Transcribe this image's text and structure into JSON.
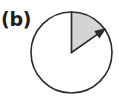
{
  "figure": {
    "panel_label": "(b)",
    "caption_text": "(b)",
    "background_color": "#ffffff",
    "stroke_color": "#2b2b2b",
    "sector_fill_color": "#d4d4d4",
    "label_color": "#1d1d1d"
  },
  "chart_data": {
    "type": "pie",
    "title": "(b)",
    "center": {
      "x": 71.5,
      "y": 52.5
    },
    "radius": 40.5,
    "start_angle_deg": 0,
    "end_angle_deg": 55,
    "sweep_direction": "clockwise",
    "angle_reference": "12 o'clock (vertical up)",
    "slices": [
      {
        "name": "shaded-sector",
        "angle_deg": 55,
        "fraction": 0.153,
        "fill": "#d4d4d4",
        "shaded": true
      },
      {
        "name": "unshaded-remainder",
        "angle_deg": 305,
        "fraction": 0.847,
        "fill": "#ffffff",
        "shaded": false
      }
    ],
    "annotations": [
      {
        "name": "arrowhead",
        "at_angle_deg": 55,
        "points": "clockwise-along-arc"
      },
      {
        "name": "panel-label",
        "text": "(b)",
        "x": 2,
        "y": 19
      }
    ],
    "grid": false,
    "legend": false
  }
}
